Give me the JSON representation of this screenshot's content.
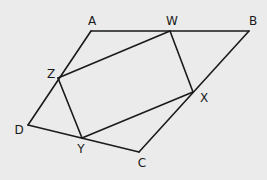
{
  "diagram": {
    "type": "geometry",
    "background": "#ebebeb",
    "stroke_color": "#1a1a1a",
    "vertices": {
      "A": {
        "x": 91,
        "y": 31,
        "label": "A",
        "lx": 92,
        "ly": 21
      },
      "W": {
        "x": 170,
        "y": 31,
        "label": "W",
        "lx": 172,
        "ly": 21
      },
      "B": {
        "x": 249,
        "y": 31,
        "label": "B",
        "lx": 253,
        "ly": 21
      },
      "Z": {
        "x": 58,
        "y": 78,
        "label": "Z",
        "lx": 51,
        "ly": 74
      },
      "X": {
        "x": 193,
        "y": 92,
        "label": "X",
        "lx": 204,
        "ly": 98
      },
      "D": {
        "x": 28,
        "y": 125,
        "label": "D",
        "lx": 19,
        "ly": 130
      },
      "Y": {
        "x": 82,
        "y": 138,
        "label": "Y",
        "lx": 81,
        "ly": 149
      },
      "C": {
        "x": 139,
        "y": 152,
        "label": "C",
        "lx": 142,
        "ly": 163
      }
    },
    "outer_quadrilateral": [
      "A",
      "B",
      "C",
      "D"
    ],
    "inner_quadrilateral": [
      "W",
      "X",
      "Y",
      "Z"
    ],
    "edges": [
      [
        "A",
        "B"
      ],
      [
        "B",
        "C"
      ],
      [
        "C",
        "D"
      ],
      [
        "D",
        "A"
      ],
      [
        "W",
        "X"
      ],
      [
        "X",
        "Y"
      ],
      [
        "Y",
        "Z"
      ],
      [
        "Z",
        "W"
      ]
    ],
    "labels": [
      "A",
      "W",
      "B",
      "Z",
      "X",
      "D",
      "Y",
      "C"
    ]
  }
}
